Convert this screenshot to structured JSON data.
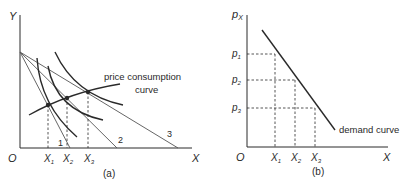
{
  "panel_a": {
    "caption": "(a)",
    "y_axis_label": "Y",
    "x_axis_label": "X",
    "origin_label": "O",
    "x_ticks": [
      {
        "main": "X",
        "sub": "1"
      },
      {
        "main": "X",
        "sub": "2"
      },
      {
        "main": "X",
        "sub": "3"
      }
    ],
    "budget_line_labels": [
      "1",
      "2",
      "3"
    ],
    "pcc_label_line1": "price consumption",
    "pcc_label_line2": "curve"
  },
  "panel_b": {
    "caption": "(b)",
    "y_axis_label_main": "p",
    "y_axis_label_sub": "X",
    "x_axis_label": "X",
    "origin_label": "O",
    "price_ticks": [
      {
        "main": "p",
        "sub": "1"
      },
      {
        "main": "p",
        "sub": "2"
      },
      {
        "main": "p",
        "sub": "3"
      }
    ],
    "x_ticks": [
      {
        "main": "X",
        "sub": "1"
      },
      {
        "main": "X",
        "sub": "2"
      },
      {
        "main": "X",
        "sub": "3"
      }
    ],
    "demand_label": "demand curve"
  },
  "colors": {
    "line": "#2a2a2a",
    "light_line": "#555555",
    "background": "#ffffff"
  }
}
